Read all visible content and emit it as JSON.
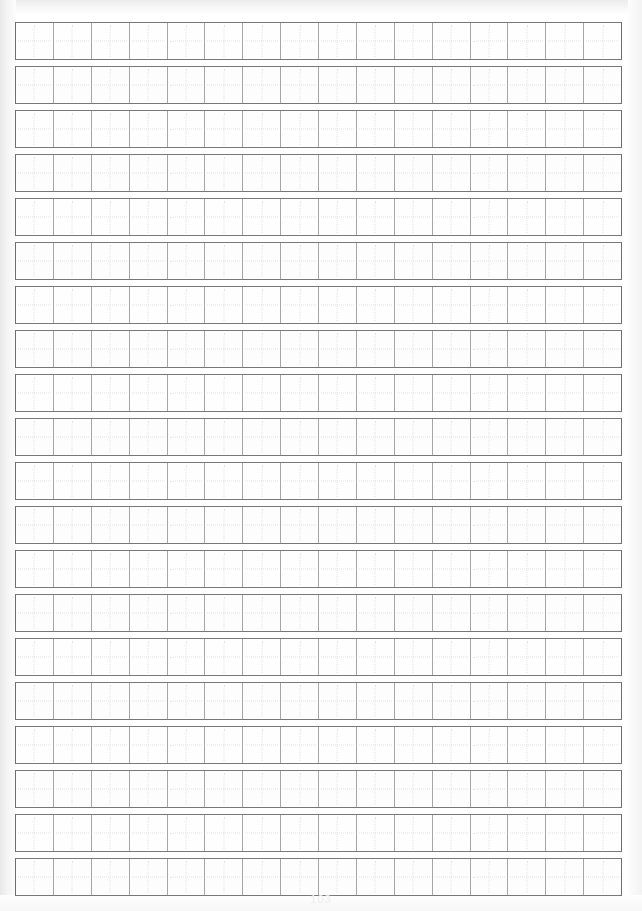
{
  "document": {
    "kind": "chinese-character-practice-grid",
    "title": "Grid Practice Paper",
    "page_width": 642,
    "page_height": 911
  },
  "grid": {
    "columns": 16,
    "rows": 20,
    "cell_size_px": 38,
    "row_gap_px": 6,
    "grid_left_px": 15,
    "grid_top_px": 22,
    "grid_width_px": 607,
    "cell_guide": "dotted-cross",
    "row_labels": [
      "row-1",
      "row-2",
      "row-3",
      "row-4",
      "row-5",
      "row-6",
      "row-7",
      "row-8",
      "row-9",
      "row-10",
      "row-11",
      "row-12",
      "row-13",
      "row-14",
      "row-15",
      "row-16",
      "row-17",
      "row-18",
      "row-19",
      "row-20"
    ],
    "cell_contents": [
      [
        "",
        "",
        "",
        "",
        "",
        "",
        "",
        "",
        "",
        "",
        "",
        "",
        "",
        "",
        "",
        ""
      ],
      [
        "",
        "",
        "",
        "",
        "",
        "",
        "",
        "",
        "",
        "",
        "",
        "",
        "",
        "",
        "",
        ""
      ],
      [
        "",
        "",
        "",
        "",
        "",
        "",
        "",
        "",
        "",
        "",
        "",
        "",
        "",
        "",
        "",
        ""
      ],
      [
        "",
        "",
        "",
        "",
        "",
        "",
        "",
        "",
        "",
        "",
        "",
        "",
        "",
        "",
        "",
        ""
      ],
      [
        "",
        "",
        "",
        "",
        "",
        "",
        "",
        "",
        "",
        "",
        "",
        "",
        "",
        "",
        "",
        ""
      ],
      [
        "",
        "",
        "",
        "",
        "",
        "",
        "",
        "",
        "",
        "",
        "",
        "",
        "",
        "",
        "",
        ""
      ],
      [
        "",
        "",
        "",
        "",
        "",
        "",
        "",
        "",
        "",
        "",
        "",
        "",
        "",
        "",
        "",
        ""
      ],
      [
        "",
        "",
        "",
        "",
        "",
        "",
        "",
        "",
        "",
        "",
        "",
        "",
        "",
        "",
        "",
        ""
      ],
      [
        "",
        "",
        "",
        "",
        "",
        "",
        "",
        "",
        "",
        "",
        "",
        "",
        "",
        "",
        "",
        ""
      ],
      [
        "",
        "",
        "",
        "",
        "",
        "",
        "",
        "",
        "",
        "",
        "",
        "",
        "",
        "",
        "",
        ""
      ],
      [
        "",
        "",
        "",
        "",
        "",
        "",
        "",
        "",
        "",
        "",
        "",
        "",
        "",
        "",
        "",
        ""
      ],
      [
        "",
        "",
        "",
        "",
        "",
        "",
        "",
        "",
        "",
        "",
        "",
        "",
        "",
        "",
        "",
        ""
      ],
      [
        "",
        "",
        "",
        "",
        "",
        "",
        "",
        "",
        "",
        "",
        "",
        "",
        "",
        "",
        "",
        ""
      ],
      [
        "",
        "",
        "",
        "",
        "",
        "",
        "",
        "",
        "",
        "",
        "",
        "",
        "",
        "",
        "",
        ""
      ],
      [
        "",
        "",
        "",
        "",
        "",
        "",
        "",
        "",
        "",
        "",
        "",
        "",
        "",
        "",
        "",
        ""
      ],
      [
        "",
        "",
        "",
        "",
        "",
        "",
        "",
        "",
        "",
        "",
        "",
        "",
        "",
        "",
        "",
        ""
      ],
      [
        "",
        "",
        "",
        "",
        "",
        "",
        "",
        "",
        "",
        "",
        "",
        "",
        "",
        "",
        "",
        ""
      ],
      [
        "",
        "",
        "",
        "",
        "",
        "",
        "",
        "",
        "",
        "",
        "",
        "",
        "",
        "",
        "",
        ""
      ],
      [
        "",
        "",
        "",
        "",
        "",
        "",
        "",
        "",
        "",
        "",
        "",
        "",
        "",
        "",
        "",
        ""
      ],
      [
        "",
        "",
        "",
        "",
        "",
        "",
        "",
        "",
        "",
        "",
        "",
        "",
        "",
        "",
        "",
        ""
      ]
    ]
  },
  "footer": {
    "page_number": "103"
  },
  "colors": {
    "page_background": "#ffffff",
    "cell_background": "#fefefe",
    "row_border": "#787878",
    "column_divider": "#a6a6a6",
    "cell_guide": "#e2e2e2",
    "scan_edge": "#ececec",
    "page_number": "#ededed"
  }
}
